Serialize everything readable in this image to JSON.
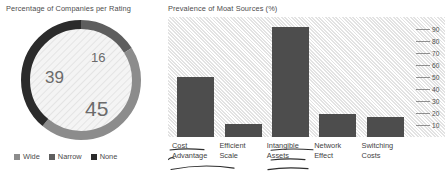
{
  "donut_panel": {
    "title": "Percentage of Companies per Rating",
    "legend": [
      {
        "label": "Wide",
        "color": "#8c8c8c"
      },
      {
        "label": "Narrow",
        "color": "#5e5e5e"
      },
      {
        "label": "None",
        "color": "#2b2b2b"
      }
    ],
    "labels": {
      "wide": "45",
      "narrow": "16",
      "none": "39"
    }
  },
  "bar_panel": {
    "title": "Prevalence of Moat Sources (%)"
  },
  "chart_data": [
    {
      "type": "pie",
      "title": "Percentage of Companies per Rating",
      "subtype": "donut",
      "categories": [
        "Wide",
        "Narrow",
        "None"
      ],
      "values": [
        45,
        16,
        39
      ],
      "colors": [
        "#8c8c8c",
        "#5e5e5e",
        "#2b2b2b"
      ],
      "data_labels": [
        "45",
        "16",
        "39"
      ],
      "legend_position": "bottom",
      "units": "%"
    },
    {
      "type": "bar",
      "title": "Prevalence of Moat Sources (%)",
      "categories": [
        "Cost Advantage",
        "Efficient Scale",
        "Intangible Assets",
        "Network Effect",
        "Switching Costs"
      ],
      "values": [
        50,
        11,
        92,
        19,
        17
      ],
      "xlabel": "",
      "ylabel": "",
      "ylim": [
        0,
        100
      ],
      "yticks": [
        10,
        20,
        30,
        40,
        50,
        60,
        70,
        80,
        90
      ],
      "ytick_labels": [
        "10",
        "20",
        "30",
        "40",
        "50",
        "60",
        "70",
        "80",
        "90"
      ],
      "axis_position": "right",
      "grid": false,
      "bar_color": "#4d4d4d",
      "plot_background": "#f2f2f2",
      "annotations": [
        {
          "text": "Cost Advantage",
          "type": "handwritten-underline"
        },
        {
          "text": "Intangible Assets",
          "type": "handwritten-underline"
        }
      ]
    }
  ]
}
